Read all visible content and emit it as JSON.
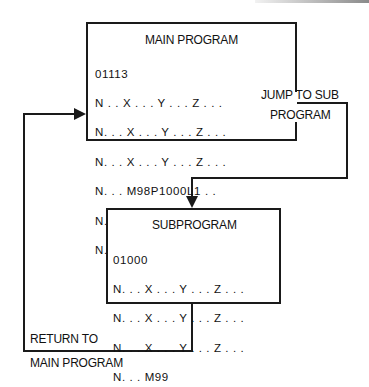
{
  "main_program": {
    "title": "MAIN PROGRAM",
    "lines": [
      "01113",
      "N . . X . . . Y . . . Z . . .",
      "N. . . X . . . Y . . . Z . . .",
      "N. . . X . . . Y . . . Z . . .",
      "N. . . M98P1000L1 . .",
      "N. . . X . . . Y . . . Z . . .",
      "N. . . M30"
    ]
  },
  "subprogram": {
    "title": "SUBPROGRAM",
    "lines": [
      "01000",
      "N. . . X . . . Y . . . Z . . .",
      "N. . . X . . . Y . . . Z . . .",
      "N. . . X . . . Y . . . Z . . .",
      "N. . . M99"
    ]
  },
  "jump_label": {
    "line1": "JUMP TO SUB",
    "line2": "PROGRAM"
  },
  "return_label": {
    "line1": "RETURN TO",
    "line2": "MAIN PROGRAM"
  },
  "colors": {
    "line": "#1a1a1a",
    "background": "#ffffff"
  }
}
